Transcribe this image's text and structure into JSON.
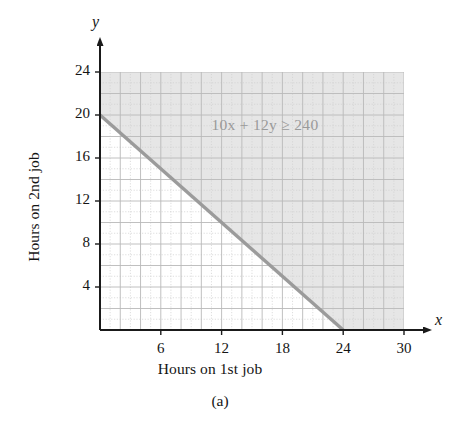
{
  "figure": {
    "caption": "(a)",
    "x_axis_title": "Hours on 1st job",
    "y_axis_title": "Hours on 2nd job",
    "x_var": "x",
    "y_var": "y",
    "inequality_label": "10x + 12y ≥ 240"
  },
  "chart_data": {
    "type": "line",
    "title": "",
    "subtitle": "",
    "xlabel": "Hours on 1st job",
    "ylabel": "Hours on 2nd job",
    "xlim": [
      0,
      30
    ],
    "ylim": [
      0,
      24
    ],
    "xticks": [
      6,
      12,
      18,
      24,
      30
    ],
    "yticks": [
      4,
      8,
      12,
      16,
      20,
      24
    ],
    "xtick_labels": [
      "6",
      "12",
      "18",
      "24",
      "30"
    ],
    "ytick_labels": [
      "4",
      "8",
      "12",
      "16",
      "20",
      "24"
    ],
    "grid": true,
    "grid_major_step": 2,
    "grid_minor_step": 1,
    "legend": null,
    "annotations": [
      {
        "text": "10x + 12y ≥ 240",
        "x": 11,
        "y": 19,
        "color": "#9a9a9a"
      }
    ],
    "series": [
      {
        "name": "10x + 12y = 240",
        "type": "line",
        "style": "solid",
        "color": "#9b9b9b",
        "x": [
          0,
          24
        ],
        "y": [
          20,
          0
        ]
      }
    ],
    "shaded_regions": [
      {
        "name": "10x + 12y ≥ 240",
        "description": "Region above and right of the boundary line",
        "color": "#e6e6e6",
        "inequality": "10x + 12y ≥ 240",
        "vertices": [
          [
            0,
            20
          ],
          [
            24,
            0
          ],
          [
            30,
            0
          ],
          [
            30,
            24
          ],
          [
            0,
            24
          ]
        ]
      }
    ]
  },
  "colors": {
    "axis": "#1a1a1a",
    "line": "#9b9b9b",
    "shade": "#e4e4e4",
    "grid_major": "#bdbdbd",
    "grid_minor": "#d4d4d4",
    "text": "#141414",
    "label_gray": "#9a9a9a"
  },
  "ticks": {
    "x": [
      {
        "label": "6",
        "value": 6
      },
      {
        "label": "12",
        "value": 12
      },
      {
        "label": "18",
        "value": 18
      },
      {
        "label": "24",
        "value": 24
      },
      {
        "label": "30",
        "value": 30
      }
    ],
    "y": [
      {
        "label": "4",
        "value": 4
      },
      {
        "label": "8",
        "value": 8
      },
      {
        "label": "12",
        "value": 12
      },
      {
        "label": "16",
        "value": 16
      },
      {
        "label": "20",
        "value": 20
      },
      {
        "label": "24",
        "value": 24
      }
    ]
  }
}
